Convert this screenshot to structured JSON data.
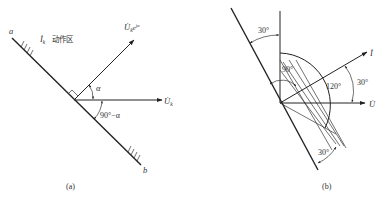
{
  "figure_a": {
    "endpoint_a_label": "a",
    "endpoint_b_label": "b",
    "zone_current_symbol": "İ",
    "zone_current_subscript": "k",
    "zone_text": "动作区",
    "vector_rotated_symbol": "U̇",
    "vector_rotated_subscript": "k",
    "vector_rotated_exp": "e",
    "vector_rotated_exp_power": "jα",
    "vector_ref_symbol": "U̇",
    "vector_ref_subscript": "k",
    "angle_alpha": "α",
    "angle_complement": "90°−α",
    "caption": "(a)"
  },
  "figure_b": {
    "angle_top": "30°",
    "angle_inner": "90°",
    "angle_wide": "120°",
    "angle_current": "30°",
    "angle_bottom": "30°",
    "current_label": "İ",
    "voltage_label": "U̇",
    "caption": "(b)"
  }
}
